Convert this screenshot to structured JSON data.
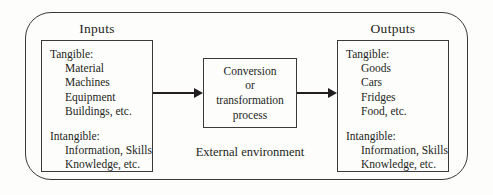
{
  "diagram": {
    "type": "input-transformation-output process model",
    "external_label": "External environment",
    "inputs": {
      "title": "Inputs",
      "tangible_label": "Tangible:",
      "tangible_items": [
        "Material",
        "Machines",
        "Equipment",
        "Buildings, etc."
      ],
      "intangible_label": "Intangible:",
      "intangible_items": [
        "Information, Skills",
        "Knowledge, etc."
      ]
    },
    "process": {
      "line1": "Conversion",
      "line2": "or",
      "line3": "transformation",
      "line4": "process"
    },
    "outputs": {
      "title": "Outputs",
      "tangible_label": "Tangible:",
      "tangible_items": [
        "Goods",
        "Cars",
        "Fridges",
        "Food, etc."
      ],
      "intangible_label": "Intangible:",
      "intangible_items": [
        "Information, Skills",
        "Knowledge, etc."
      ]
    },
    "colors": {
      "line": "#3a3a3a",
      "text": "#231f20",
      "background": "#fdfdfc"
    }
  }
}
